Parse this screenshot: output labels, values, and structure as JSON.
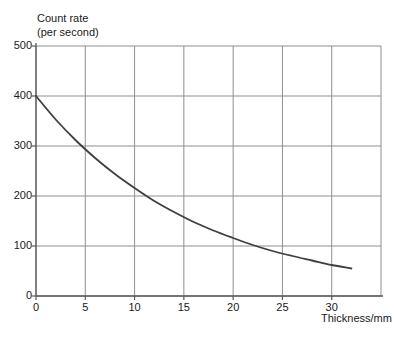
{
  "axis_titles": {
    "y_line1": "Count rate",
    "y_line2": "(per second)",
    "x": "Thickness/mm"
  },
  "chart_data": {
    "type": "line",
    "title": "",
    "xlabel": "Thickness/mm",
    "ylabel": "Count rate (per second)",
    "xlim": [
      0,
      35
    ],
    "ylim": [
      0,
      500
    ],
    "xticks": [
      0,
      5,
      10,
      15,
      20,
      25,
      30
    ],
    "yticks": [
      0,
      100,
      200,
      300,
      400,
      500
    ],
    "grid": true,
    "legend_position": "none",
    "colors": {
      "grid": "#8f8f8f",
      "axis": "#5a5a5a",
      "curve": "#3f3f3f",
      "text": "#1a1a1a",
      "background": "#ffffff"
    },
    "series": [
      {
        "name": "count rate vs absorber thickness",
        "points": [
          [
            0,
            400
          ],
          [
            2,
            353
          ],
          [
            4,
            312
          ],
          [
            6,
            276
          ],
          [
            8,
            244
          ],
          [
            10,
            216
          ],
          [
            12,
            190
          ],
          [
            14,
            168
          ],
          [
            16,
            148
          ],
          [
            18,
            131
          ],
          [
            20,
            116
          ],
          [
            22,
            102
          ],
          [
            24,
            90
          ],
          [
            26,
            80
          ],
          [
            28,
            71
          ],
          [
            30,
            62
          ],
          [
            32,
            55
          ]
        ]
      }
    ]
  }
}
